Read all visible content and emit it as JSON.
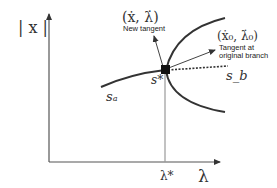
{
  "diagram": {
    "y_axis_label": "| x |",
    "x_axis_label": "λ",
    "bifurcation_param_label": "λ*",
    "new_tangent": {
      "math": "(ẋ, λ̇)",
      "caption": "New tangent"
    },
    "original_tangent": {
      "math": "(ẋ₀, λ̇₀)",
      "caption_line1": "Tangent at",
      "caption_line2": "original branch"
    },
    "branch_labels": {
      "s_a": "sₐ",
      "s_b": "s_b",
      "s_star": "s*"
    }
  }
}
